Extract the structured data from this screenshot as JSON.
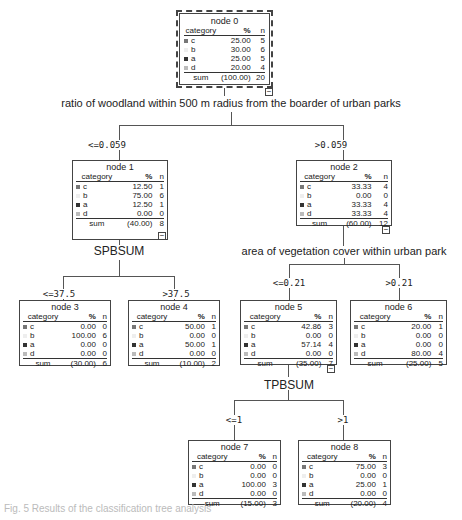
{
  "columns": {
    "category": "category",
    "pct": "%",
    "n": "n"
  },
  "sum_label": "sum",
  "category_colors": {
    "c": "#777777",
    "b": "#eeeeee",
    "a": "#333333",
    "d": "#bbbbbb"
  },
  "nodes": {
    "n0": {
      "title": "node 0",
      "rows": [
        {
          "cat": "c",
          "pct": "25.00",
          "n": "5"
        },
        {
          "cat": "b",
          "pct": "30.00",
          "n": "6"
        },
        {
          "cat": "a",
          "pct": "25.00",
          "n": "5"
        },
        {
          "cat": "d",
          "pct": "20.00",
          "n": "4"
        }
      ],
      "sum_pct": "(100.00)",
      "sum_n": "20"
    },
    "n1": {
      "title": "node 1",
      "rows": [
        {
          "cat": "c",
          "pct": "12.50",
          "n": "1"
        },
        {
          "cat": "b",
          "pct": "75.00",
          "n": "6"
        },
        {
          "cat": "a",
          "pct": "12.50",
          "n": "1"
        },
        {
          "cat": "d",
          "pct": "0.00",
          "n": "0"
        }
      ],
      "sum_pct": "(40.00)",
      "sum_n": "8"
    },
    "n2": {
      "title": "node 2",
      "rows": [
        {
          "cat": "c",
          "pct": "33.33",
          "n": "4"
        },
        {
          "cat": "b",
          "pct": "0.00",
          "n": "0"
        },
        {
          "cat": "a",
          "pct": "33.33",
          "n": "4"
        },
        {
          "cat": "d",
          "pct": "33.33",
          "n": "4"
        }
      ],
      "sum_pct": "(60.00)",
      "sum_n": "12"
    },
    "n3": {
      "title": "node 3",
      "rows": [
        {
          "cat": "c",
          "pct": "0.00",
          "n": "0"
        },
        {
          "cat": "b",
          "pct": "100.00",
          "n": "6"
        },
        {
          "cat": "a",
          "pct": "0.00",
          "n": "0"
        },
        {
          "cat": "d",
          "pct": "0.00",
          "n": "0"
        }
      ],
      "sum_pct": "(30.00)",
      "sum_n": "6"
    },
    "n4": {
      "title": "node 4",
      "rows": [
        {
          "cat": "c",
          "pct": "50.00",
          "n": "1"
        },
        {
          "cat": "b",
          "pct": "0.00",
          "n": "0"
        },
        {
          "cat": "a",
          "pct": "50.00",
          "n": "1"
        },
        {
          "cat": "d",
          "pct": "0.00",
          "n": "0"
        }
      ],
      "sum_pct": "(10.00)",
      "sum_n": "2"
    },
    "n5": {
      "title": "node 5",
      "rows": [
        {
          "cat": "c",
          "pct": "42.86",
          "n": "3"
        },
        {
          "cat": "b",
          "pct": "0.00",
          "n": "0"
        },
        {
          "cat": "a",
          "pct": "57.14",
          "n": "4"
        },
        {
          "cat": "d",
          "pct": "0.00",
          "n": "0"
        }
      ],
      "sum_pct": "(35.00)",
      "sum_n": "7"
    },
    "n6": {
      "title": "node 6",
      "rows": [
        {
          "cat": "c",
          "pct": "20.00",
          "n": "1"
        },
        {
          "cat": "b",
          "pct": "0.00",
          "n": "0"
        },
        {
          "cat": "a",
          "pct": "0.00",
          "n": "0"
        },
        {
          "cat": "d",
          "pct": "80.00",
          "n": "4"
        }
      ],
      "sum_pct": "(25.00)",
      "sum_n": "5"
    },
    "n7": {
      "title": "node 7",
      "rows": [
        {
          "cat": "c",
          "pct": "0.00",
          "n": "0"
        },
        {
          "cat": "b",
          "pct": "0.00",
          "n": "0"
        },
        {
          "cat": "a",
          "pct": "100.00",
          "n": "3"
        },
        {
          "cat": "d",
          "pct": "0.00",
          "n": "0"
        }
      ],
      "sum_pct": "(15.00)",
      "sum_n": "3"
    },
    "n8": {
      "title": "node 8",
      "rows": [
        {
          "cat": "c",
          "pct": "75.00",
          "n": "3"
        },
        {
          "cat": "b",
          "pct": "0.00",
          "n": "0"
        },
        {
          "cat": "a",
          "pct": "25.00",
          "n": "1"
        },
        {
          "cat": "d",
          "pct": "0.00",
          "n": "0"
        }
      ],
      "sum_pct": "(20.00)",
      "sum_n": "4"
    }
  },
  "splits": {
    "s0": {
      "variable": "ratio of woodland within 500 m radius from the boarder of urban parks",
      "left": "<=0.059",
      "right": ">0.059"
    },
    "s1": {
      "variable": "SPBSUM",
      "left": "<=37.5",
      "right": ">37.5"
    },
    "s2": {
      "variable": "area of vegetation cover within urban park",
      "left": "<=0.21",
      "right": ">0.21"
    },
    "s5": {
      "variable": "TPBSUM",
      "left": "<=1",
      "right": ">1"
    }
  },
  "collapse_symbol": "−",
  "caption": "Fig. 5 Results of the classification tree analysis"
}
